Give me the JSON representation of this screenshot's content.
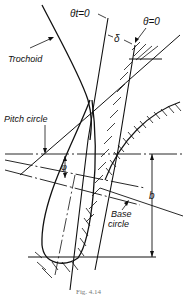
{
  "figure": {
    "caption": "Fig. 4.14",
    "labels": {
      "theta_t": "θt=0",
      "theta": "θ=0",
      "delta": "δ",
      "trochoid": "Trochoid",
      "pitch_circle": "Pitch circle",
      "phi": "φ",
      "base_circle_line1": "Base",
      "base_circle_line2": "circle",
      "b": "b"
    },
    "colors": {
      "line": "#111111",
      "background": "#ffffff",
      "caption": "#777777"
    }
  }
}
